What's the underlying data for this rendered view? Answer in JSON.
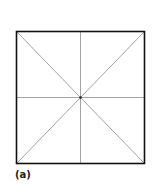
{
  "figure": {
    "label": "(a)",
    "square": {
      "x": 16,
      "y": 31,
      "size": 129,
      "stroke": "#111111",
      "stroke_width": 1.6
    },
    "lines_color": "#8c8c8c",
    "center_dot_color": "#222222"
  }
}
